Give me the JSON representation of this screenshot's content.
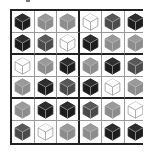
{
  "puzzle": {
    "type": "cube-color-grid",
    "rows": 6,
    "cols": 6,
    "block_rows": 2,
    "block_cols": 3,
    "colors": {
      "black": {
        "face": "#1c1c1c",
        "top": "#2e2e2e",
        "edge": "#9a9a9a"
      },
      "dark": {
        "face": "#4a4a4a",
        "top": "#585858",
        "edge": "#a8a8a8"
      },
      "gray": {
        "face": "#8c8c8c",
        "top": "#9a9a9a",
        "edge": "#b8b8b8"
      },
      "white": {
        "face": "#ffffff",
        "top": "#ffffff",
        "edge": "#9a9a9a"
      }
    },
    "grid": [
      [
        "black",
        "gray",
        "gray",
        "white",
        "dark",
        "black"
      ],
      [
        "black",
        "dark",
        "white",
        "black",
        "gray",
        "gray"
      ],
      [
        "white",
        "gray",
        "black",
        "gray",
        "black",
        "dark"
      ],
      [
        "gray",
        "black",
        "dark",
        "black",
        "white",
        "gray"
      ],
      [
        "gray",
        "black",
        "black",
        "dark",
        "gray",
        "white"
      ],
      [
        "dark",
        "white",
        "gray",
        "gray",
        "black",
        "black"
      ]
    ]
  }
}
